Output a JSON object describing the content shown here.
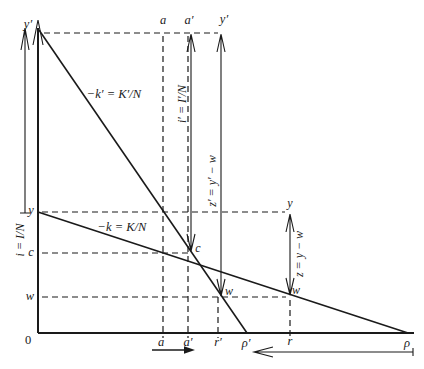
{
  "diagram": {
    "colors": {
      "ink": "#1a1a1a",
      "background": "#ffffff"
    },
    "origin_label": "0",
    "top_labels": {
      "a": "a",
      "a_prime": "a′",
      "y_prime": "y′"
    },
    "axis_top_label": "y′",
    "left_labels": {
      "y": "y",
      "c": "c",
      "w": "w"
    },
    "line_labels": {
      "k_prime": "−k′ = K′/N",
      "k": "−k = K/N"
    },
    "arrow_labels": {
      "i": "i = I/N",
      "i_prime": "i′ = I′/N",
      "z_prime": "z′ = y′ − w",
      "z": "z = y − w"
    },
    "point_labels": {
      "c": "c",
      "w_mid": "w",
      "w_right": "w",
      "y_right": "y"
    },
    "bottom_labels": {
      "a": "a",
      "a_prime": "a′",
      "r_prime": "r′",
      "rho_prime": "ρ′",
      "r": "r",
      "rho": "ρ"
    }
  }
}
